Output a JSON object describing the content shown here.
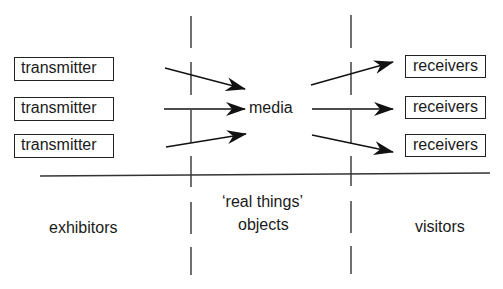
{
  "diagram": {
    "transmitters": [
      "transmitter",
      "transmitter",
      "transmitter"
    ],
    "center_label": "media",
    "receivers": [
      "receivers",
      "receivers",
      "receivers"
    ],
    "zones": {
      "left": "exhibitors",
      "middle_line1": "‘real things’",
      "middle_line2": "objects",
      "right": "visitors"
    },
    "colors": {
      "line": "#222222",
      "background": "#ffffff"
    }
  }
}
